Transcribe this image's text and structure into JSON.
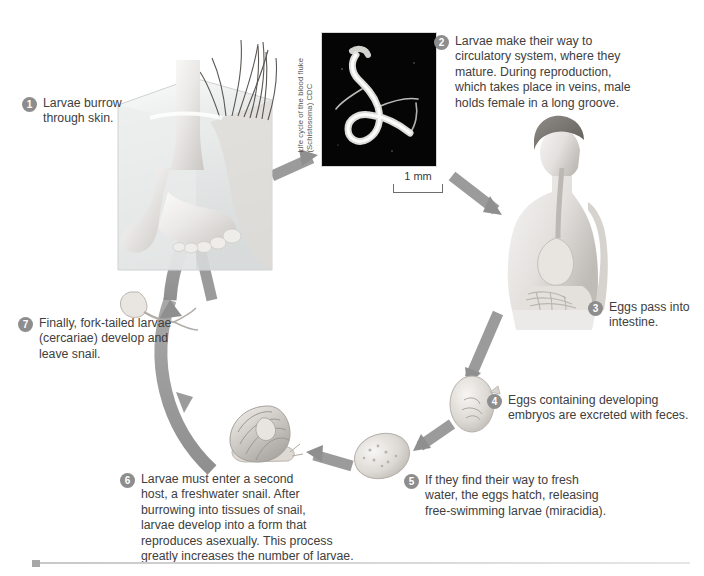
{
  "figure": {
    "title": "Life cycle of the blood fluke (Schistosoma)",
    "credit_vertical": "Life cycle of the blood fluke\n(Schistosoma) CDC",
    "scale_bar_label": "1 mm",
    "accent_color": "#8d8d8d",
    "arrow_color": "#8a8a8a",
    "background_color": "#ffffff",
    "micrograph_background": "#050505"
  },
  "steps": [
    {
      "number": "1",
      "text": "Larvae burrow\nthrough skin."
    },
    {
      "number": "2",
      "text": "Larvae make their way to\ncirculatory system, where they\nmature. During reproduction,\nwhich takes place in veins, male\nholds female in a long groove."
    },
    {
      "number": "3",
      "text": "Eggs pass into\nintestine."
    },
    {
      "number": "4",
      "text": "Eggs containing developing\nembryos are excreted with feces."
    },
    {
      "number": "5",
      "text": "If they find their way to fresh\nwater, the eggs hatch, releasing\nfree-swimming larvae (miracidia)."
    },
    {
      "number": "6",
      "text": "Larvae must enter a second\nhost, a freshwater snail. After\nburrowing into tissues of snail,\nlarvae develop into a form that\nreproduces asexually. This process\ngreatly increases the number of larvae."
    },
    {
      "number": "7",
      "text": "Finally, fork-tailed larvae\n(cercariae) develop and\nleave snail."
    }
  ],
  "illustrations": [
    {
      "name": "foot-in-water-block",
      "caption": "Human foot standing in a transparent block of water with reeds"
    },
    {
      "name": "schistosome-micrograph",
      "caption": "Dark-field micrograph of paired adult blood flukes"
    },
    {
      "name": "human-torso-digestive",
      "caption": "Human torso in profile showing esophagus, stomach and intestines"
    },
    {
      "name": "egg-with-embryo",
      "caption": "Egg containing developing embryo"
    },
    {
      "name": "hatching-egg",
      "caption": "Egg hatching in fresh water"
    },
    {
      "name": "freshwater-snail",
      "caption": "Freshwater snail, second host"
    },
    {
      "name": "fork-tailed-cercaria",
      "caption": "Fork-tailed cercaria larva"
    }
  ]
}
